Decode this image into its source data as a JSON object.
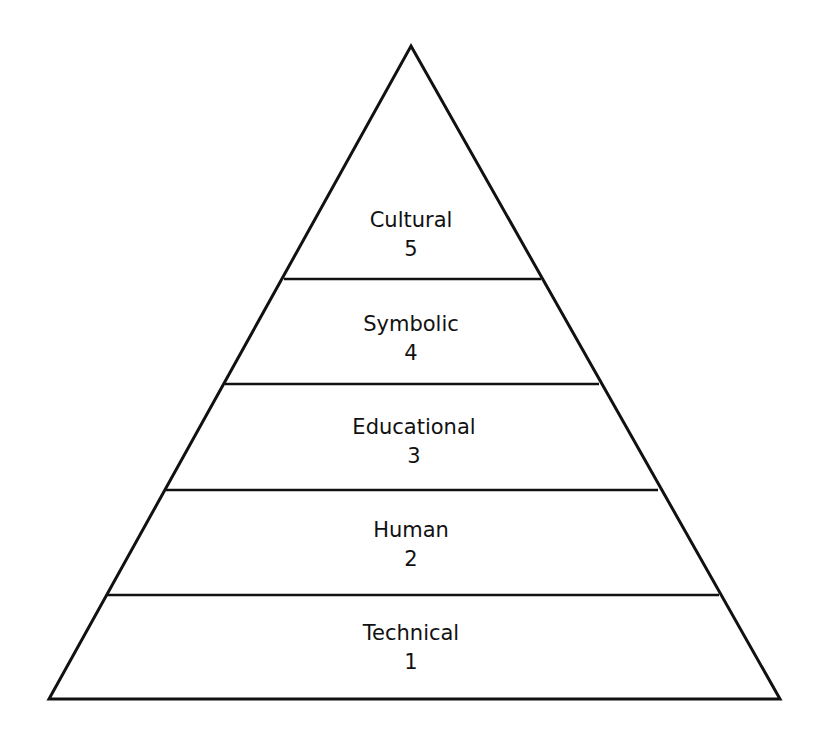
{
  "diagram": {
    "type": "pyramid",
    "stroke_color": "#111111",
    "fill_color": "#ffffff",
    "levels": [
      {
        "name": "Cultural",
        "number": "5"
      },
      {
        "name": "Symbolic",
        "number": "4"
      },
      {
        "name": "Educational",
        "number": "3"
      },
      {
        "name": "Human",
        "number": "2"
      },
      {
        "name": "Technical",
        "number": "1"
      }
    ]
  }
}
